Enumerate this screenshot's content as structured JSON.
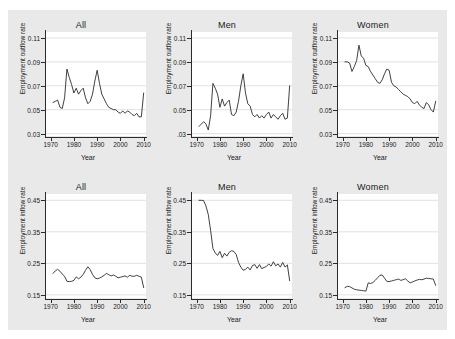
{
  "figure": {
    "background_color": "#e9e9e9",
    "panel_color": "#ffffff",
    "line_color": "#2b2b2b",
    "grid_color": "#d4d4d4"
  },
  "chart_data": [
    {
      "type": "line",
      "title": "All",
      "xlabel": "Year",
      "ylabel": "Employment outflow rate",
      "xlim": [
        1968,
        2011
      ],
      "ylim": [
        0.028,
        0.115
      ],
      "xticks": [
        1970,
        1980,
        1990,
        2000,
        2010
      ],
      "xticklabels": [
        "1970",
        "1980",
        "1990",
        "2000",
        "2010"
      ],
      "yticks": [
        0.03,
        0.05,
        0.07,
        0.09,
        0.11
      ],
      "yticklabels": [
        "0.03",
        "0.05",
        "0.07",
        "0.09",
        "0.11"
      ],
      "grid": "horizontal",
      "legend": "none",
      "x": [
        1971,
        1972,
        1973,
        1974,
        1975,
        1976,
        1977,
        1978,
        1979,
        1980,
        1981,
        1982,
        1983,
        1984,
        1985,
        1986,
        1987,
        1988,
        1989,
        1990,
        1991,
        1992,
        1993,
        1994,
        1995,
        1996,
        1997,
        1998,
        1999,
        2000,
        2001,
        2002,
        2003,
        2004,
        2005,
        2006,
        2007,
        2008,
        2009,
        2010
      ],
      "values": [
        0.056,
        0.057,
        0.058,
        0.052,
        0.051,
        0.06,
        0.084,
        0.077,
        0.071,
        0.064,
        0.068,
        0.063,
        0.066,
        0.068,
        0.06,
        0.055,
        0.057,
        0.063,
        0.074,
        0.083,
        0.072,
        0.063,
        0.059,
        0.055,
        0.052,
        0.051,
        0.05,
        0.05,
        0.048,
        0.047,
        0.049,
        0.047,
        0.049,
        0.048,
        0.046,
        0.045,
        0.047,
        0.044,
        0.044,
        0.064
      ]
    },
    {
      "type": "line",
      "title": "Men",
      "xlabel": "Year",
      "ylabel": "Employment outflow rate",
      "xlim": [
        1968,
        2011
      ],
      "ylim": [
        0.028,
        0.115
      ],
      "xticks": [
        1970,
        1980,
        1990,
        2000,
        2010
      ],
      "xticklabels": [
        "1970",
        "1980",
        "1990",
        "2000",
        "2010"
      ],
      "yticks": [
        0.03,
        0.05,
        0.07,
        0.09,
        0.11
      ],
      "yticklabels": [
        ".03",
        "0.05",
        "0.07",
        "0.09",
        "0.11"
      ],
      "grid": "horizontal",
      "legend": "none",
      "x": [
        1971,
        1972,
        1973,
        1974,
        1975,
        1976,
        1977,
        1978,
        1979,
        1980,
        1981,
        1982,
        1983,
        1984,
        1985,
        1986,
        1987,
        1988,
        1989,
        1990,
        1991,
        1992,
        1993,
        1994,
        1995,
        1996,
        1997,
        1998,
        1999,
        2000,
        2001,
        2002,
        2003,
        2004,
        2005,
        2006,
        2007,
        2008,
        2009,
        2010
      ],
      "values": [
        0.036,
        0.038,
        0.04,
        0.038,
        0.033,
        0.045,
        0.072,
        0.068,
        0.063,
        0.052,
        0.059,
        0.053,
        0.056,
        0.058,
        0.046,
        0.045,
        0.048,
        0.057,
        0.07,
        0.08,
        0.064,
        0.055,
        0.053,
        0.046,
        0.044,
        0.046,
        0.043,
        0.045,
        0.043,
        0.046,
        0.048,
        0.043,
        0.046,
        0.044,
        0.042,
        0.045,
        0.047,
        0.042,
        0.043,
        0.07
      ]
    },
    {
      "type": "line",
      "title": "Women",
      "xlabel": "Year",
      "ylabel": "Employment outflow rate",
      "xlim": [
        1968,
        2011
      ],
      "ylim": [
        0.028,
        0.115
      ],
      "xticks": [
        1970,
        1980,
        1990,
        2000,
        2010
      ],
      "xticklabels": [
        "1970",
        "1980",
        "1990",
        "2000",
        "2010"
      ],
      "yticks": [
        0.03,
        0.05,
        0.07,
        0.09,
        0.11
      ],
      "yticklabels": [
        "0.03",
        "0.05",
        "0.07",
        "0.09",
        "0.11"
      ],
      "grid": "horizontal",
      "legend": "none",
      "x": [
        1971,
        1972,
        1973,
        1974,
        1975,
        1976,
        1977,
        1978,
        1979,
        1980,
        1981,
        1982,
        1983,
        1984,
        1985,
        1986,
        1987,
        1988,
        1989,
        1990,
        1991,
        1992,
        1993,
        1994,
        1995,
        1996,
        1997,
        1998,
        1999,
        2000,
        2001,
        2002,
        2003,
        2004,
        2005,
        2006,
        2007,
        2008,
        2009,
        2010
      ],
      "values": [
        0.09,
        0.09,
        0.089,
        0.082,
        0.086,
        0.091,
        0.104,
        0.095,
        0.093,
        0.087,
        0.086,
        0.082,
        0.079,
        0.076,
        0.073,
        0.072,
        0.075,
        0.08,
        0.084,
        0.083,
        0.073,
        0.07,
        0.069,
        0.067,
        0.065,
        0.063,
        0.062,
        0.061,
        0.059,
        0.056,
        0.055,
        0.057,
        0.054,
        0.052,
        0.051,
        0.056,
        0.054,
        0.05,
        0.048,
        0.057
      ]
    },
    {
      "type": "line",
      "title": "All",
      "xlabel": "Year",
      "ylabel": "Employment inflow rate",
      "xlim": [
        1968,
        2011
      ],
      "ylim": [
        0.14,
        0.47
      ],
      "xticks": [
        1970,
        1980,
        1990,
        2000,
        2010
      ],
      "xticklabels": [
        "1970",
        "1980",
        "1990",
        "2000",
        "2010"
      ],
      "yticks": [
        0.15,
        0.25,
        0.35,
        0.45
      ],
      "yticklabels": [
        "0.15",
        "0.25",
        "0.35",
        "0.45"
      ],
      "grid": "horizontal",
      "legend": "none",
      "x": [
        1971,
        1972,
        1973,
        1974,
        1975,
        1976,
        1977,
        1978,
        1979,
        1980,
        1981,
        1982,
        1983,
        1984,
        1985,
        1986,
        1987,
        1988,
        1989,
        1990,
        1991,
        1992,
        1993,
        1994,
        1995,
        1996,
        1997,
        1998,
        1999,
        2000,
        2001,
        2002,
        2003,
        2004,
        2005,
        2006,
        2007,
        2008,
        2009,
        2010
      ],
      "values": [
        0.218,
        0.226,
        0.231,
        0.225,
        0.216,
        0.209,
        0.193,
        0.192,
        0.193,
        0.196,
        0.207,
        0.201,
        0.206,
        0.215,
        0.228,
        0.239,
        0.23,
        0.215,
        0.204,
        0.201,
        0.203,
        0.207,
        0.212,
        0.218,
        0.214,
        0.21,
        0.213,
        0.209,
        0.204,
        0.206,
        0.208,
        0.21,
        0.206,
        0.212,
        0.209,
        0.209,
        0.212,
        0.209,
        0.206,
        0.173
      ]
    },
    {
      "type": "line",
      "title": "Men",
      "xlabel": "Year",
      "ylabel": "Employment inflow rate",
      "xlim": [
        1968,
        2011
      ],
      "ylim": [
        0.14,
        0.47
      ],
      "xticks": [
        1970,
        1980,
        1990,
        2000,
        2010
      ],
      "xticklabels": [
        "1970",
        "1980",
        "1990",
        "2000",
        "2010"
      ],
      "yticks": [
        0.15,
        0.25,
        0.35,
        0.45
      ],
      "yticklabels": [
        "0.15",
        "0.25",
        "0.35",
        "0.45"
      ],
      "grid": "horizontal",
      "legend": "none",
      "x": [
        1971,
        1972,
        1973,
        1974,
        1975,
        1976,
        1977,
        1978,
        1979,
        1980,
        1981,
        1982,
        1983,
        1984,
        1985,
        1986,
        1987,
        1988,
        1989,
        1990,
        1991,
        1992,
        1993,
        1994,
        1995,
        1996,
        1997,
        1998,
        1999,
        2000,
        2001,
        2002,
        2003,
        2004,
        2005,
        2006,
        2007,
        2008,
        2009,
        2010
      ],
      "values": [
        0.45,
        0.45,
        0.449,
        0.432,
        0.405,
        0.355,
        0.297,
        0.283,
        0.275,
        0.288,
        0.268,
        0.282,
        0.273,
        0.285,
        0.29,
        0.288,
        0.278,
        0.253,
        0.238,
        0.228,
        0.231,
        0.238,
        0.229,
        0.243,
        0.246,
        0.234,
        0.246,
        0.233,
        0.237,
        0.24,
        0.248,
        0.241,
        0.255,
        0.242,
        0.248,
        0.238,
        0.253,
        0.238,
        0.245,
        0.195
      ]
    },
    {
      "type": "line",
      "title": "Women",
      "xlabel": "Year",
      "ylabel": "Employment inflow rate",
      "xlim": [
        1968,
        2011
      ],
      "ylim": [
        0.14,
        0.47
      ],
      "xticks": [
        1970,
        1980,
        1990,
        2000,
        2010
      ],
      "xticklabels": [
        "1970",
        "1980",
        "1990",
        "2000",
        "2010"
      ],
      "yticks": [
        0.15,
        0.25,
        0.35,
        0.45
      ],
      "yticklabels": [
        "0.15",
        "0.25",
        "0.35",
        "0.45"
      ],
      "grid": "horizontal",
      "legend": "none",
      "x": [
        1971,
        1972,
        1973,
        1974,
        1975,
        1976,
        1977,
        1978,
        1979,
        1980,
        1981,
        1982,
        1983,
        1984,
        1985,
        1986,
        1987,
        1988,
        1989,
        1990,
        1991,
        1992,
        1993,
        1994,
        1995,
        1996,
        1997,
        1998,
        1999,
        2000,
        2001,
        2002,
        2003,
        2004,
        2005,
        2006,
        2007,
        2008,
        2009,
        2010
      ],
      "values": [
        0.173,
        0.177,
        0.176,
        0.172,
        0.168,
        0.166,
        0.165,
        0.164,
        0.163,
        0.162,
        0.188,
        0.186,
        0.189,
        0.196,
        0.204,
        0.212,
        0.213,
        0.203,
        0.193,
        0.192,
        0.194,
        0.196,
        0.198,
        0.2,
        0.196,
        0.198,
        0.201,
        0.194,
        0.188,
        0.191,
        0.194,
        0.197,
        0.199,
        0.198,
        0.2,
        0.203,
        0.202,
        0.201,
        0.2,
        0.18
      ]
    }
  ]
}
